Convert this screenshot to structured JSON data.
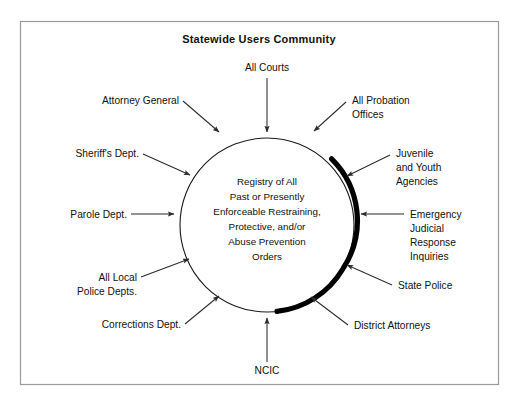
{
  "figure": {
    "title": "Statewide Users Community",
    "hub": {
      "name": "registry-hub",
      "lines": [
        "Registry of All",
        "Past or Presently",
        "Enforceable Restraining,",
        "Protective, and/or",
        "Abuse Prevention",
        "Orders"
      ]
    },
    "colors": {
      "frame": "#9a9a9a",
      "circle_outline": "#1a1a1a",
      "shadow_arc": "#000000",
      "arrow": "#2b2b2b",
      "text": "#111111",
      "background": "#ffffff"
    },
    "sources": [
      {
        "id": "all-courts",
        "lines": [
          "All Courts"
        ]
      },
      {
        "id": "attorney-general",
        "lines": [
          "Attorney General"
        ]
      },
      {
        "id": "all-probation-offices",
        "lines": [
          "All Probation",
          "Offices"
        ]
      },
      {
        "id": "sheriffs-dept",
        "lines": [
          "Sheriff's Dept."
        ]
      },
      {
        "id": "juvenile-and-youth-agencies",
        "lines": [
          "Juvenile",
          "and Youth",
          "Agencies"
        ]
      },
      {
        "id": "parole-dept",
        "lines": [
          "Parole Dept."
        ]
      },
      {
        "id": "emergency-judicial-response-inquiries",
        "lines": [
          "Emergency",
          "Judicial",
          "Response",
          "Inquiries"
        ]
      },
      {
        "id": "all-local-police-depts",
        "lines": [
          "All Local",
          "Police Depts."
        ]
      },
      {
        "id": "state-police",
        "lines": [
          "State Police"
        ]
      },
      {
        "id": "corrections-dept",
        "lines": [
          "Corrections Dept."
        ]
      },
      {
        "id": "district-attorneys",
        "lines": [
          "District Attorneys"
        ]
      },
      {
        "id": "ncic",
        "lines": [
          "NCIC"
        ]
      }
    ]
  }
}
